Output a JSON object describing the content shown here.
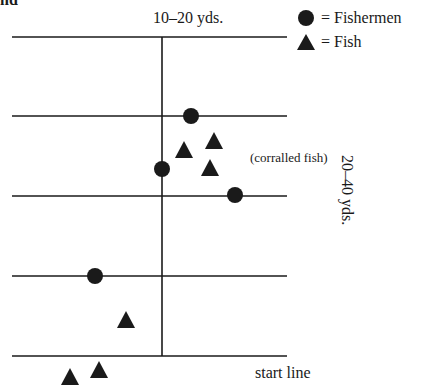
{
  "title_fragment": "nd",
  "labels": {
    "top_distance": "10–20 yds.",
    "side_distance": "20–40 yds.",
    "corralled": "(corralled fish)",
    "start_line": "start line"
  },
  "legend": [
    {
      "symbol": "circle",
      "label": "= Fishermen"
    },
    {
      "symbol": "triangle",
      "label": "= Fish"
    }
  ],
  "colors": {
    "ink": "#1a1a1a",
    "background": "#ffffff"
  },
  "grid": {
    "horizontal_lines_y": [
      37,
      116,
      196,
      276,
      356
    ],
    "x_start": 12,
    "x_end": 287,
    "vertical_line_x": 162
  },
  "fishermen": [
    {
      "x": 191,
      "y": 116
    },
    {
      "x": 162,
      "y": 169
    },
    {
      "x": 235,
      "y": 195
    },
    {
      "x": 95,
      "y": 276
    }
  ],
  "fish": [
    {
      "x": 184,
      "y": 150
    },
    {
      "x": 214,
      "y": 141
    },
    {
      "x": 210,
      "y": 168
    },
    {
      "x": 126,
      "y": 320
    },
    {
      "x": 99,
      "y": 370
    },
    {
      "x": 70,
      "y": 377
    }
  ]
}
